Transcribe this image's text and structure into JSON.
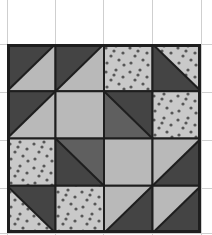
{
  "figure": {
    "grid": {
      "rows": 4,
      "cols": 4
    },
    "colors": {
      "dark": "#444444",
      "medium": "#5f5f5f",
      "light": "#b9b9b9",
      "dotted_bg": "#c9c9c9",
      "dot": "#575757",
      "border": "#1e1e1e",
      "background_grid": "#cfcfcf"
    },
    "cells": [
      [
        {
          "type": "hst",
          "diagonal": "bl-tr",
          "a": "dark",
          "b": "light"
        },
        {
          "type": "hst",
          "diagonal": "bl-tr",
          "a": "dark",
          "b": "light"
        },
        {
          "type": "dotted"
        },
        {
          "type": "hst",
          "diagonal": "tl-br",
          "a": "dotted",
          "b": "dark"
        }
      ],
      [
        {
          "type": "hst",
          "diagonal": "bl-tr",
          "a": "dark",
          "b": "light"
        },
        {
          "type": "solid",
          "fill": "light"
        },
        {
          "type": "hst",
          "diagonal": "tl-br",
          "a": "dark",
          "b": "medium"
        },
        {
          "type": "dotted"
        }
      ],
      [
        {
          "type": "dotted"
        },
        {
          "type": "hst",
          "diagonal": "tl-br",
          "a": "medium",
          "b": "dark"
        },
        {
          "type": "solid",
          "fill": "light"
        },
        {
          "type": "hst",
          "diagonal": "bl-tr",
          "a": "light",
          "b": "dark"
        }
      ],
      [
        {
          "type": "hst",
          "diagonal": "tl-br",
          "a": "dark",
          "b": "dotted"
        },
        {
          "type": "dotted"
        },
        {
          "type": "hst",
          "diagonal": "bl-tr",
          "a": "light",
          "b": "dark"
        },
        {
          "type": "hst",
          "diagonal": "bl-tr",
          "a": "light",
          "b": "dark"
        }
      ]
    ],
    "legend_note": "hst = half-square triangle; for bl-tr diagonal, a = top-left triangle, b = bottom-right triangle; for tl-br diagonal, a = top-right triangle, b = bottom-left triangle"
  }
}
